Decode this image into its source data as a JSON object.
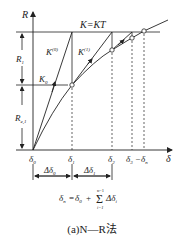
{
  "diagram": {
    "axes": {
      "y_label": "R",
      "x_label": "δ"
    },
    "labels": {
      "top_line": "K=KT",
      "k_zero_super": "K",
      "k_zero_sup": "(0)",
      "k_one": "K",
      "k_one_sup": "(1)",
      "k0": "K",
      "k0_sub": "0",
      "r1": "R",
      "r1_sub": "1",
      "re1": "R",
      "re1_sub": "e,1"
    },
    "x_ticks": [
      {
        "base": "δ",
        "sub": "0"
      },
      {
        "base": "δ",
        "sub": "1"
      },
      {
        "base": "δ",
        "sub": "2"
      },
      {
        "base": "δ",
        "sub": "3"
      },
      {
        "base": "δ",
        "sub": "n"
      }
    ],
    "x_tick_separator": "–",
    "deltas": [
      {
        "base": "Δδ",
        "sub": "0"
      },
      {
        "base": "Δδ",
        "sub": "1"
      }
    ],
    "formula": {
      "lhs": "δ",
      "lhs_sub": "n",
      "eq": "=",
      "term0": "δ",
      "term0_sub": "0",
      "plus": "+",
      "sum_sym": "Σ",
      "sum_top": "n−1",
      "sum_bottom": "i=1",
      "term": "Δδ",
      "term_sub": "i"
    },
    "caption": "(a)N—R法",
    "colors": {
      "line": "#222222",
      "background": "#ffffff"
    }
  }
}
